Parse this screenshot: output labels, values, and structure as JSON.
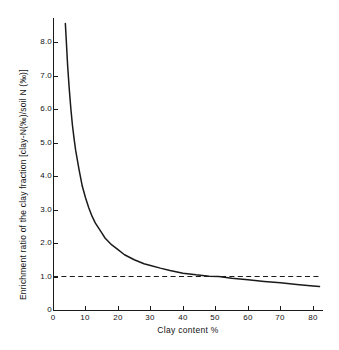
{
  "figure": {
    "background_color": "#ffffff",
    "ink_color": "#1a1a1a"
  },
  "chart_data": {
    "type": "line",
    "title": "",
    "xlabel": "Clay content %",
    "ylabel": "Enrichment ratio of the clay fraction [clay-N(‰)/soil N (‰)]",
    "xlim": [
      0,
      82
    ],
    "ylim": [
      0,
      8.6
    ],
    "grid": false,
    "legend": "none",
    "x_ticks": [
      0,
      10,
      20,
      30,
      40,
      50,
      60,
      70,
      80
    ],
    "x_tick_labels": [
      "0",
      "10",
      "20",
      "30",
      "40",
      "50",
      "60",
      "70",
      "80"
    ],
    "y_ticks": [
      0,
      1.0,
      2.0,
      3.0,
      4.0,
      5.0,
      6.0,
      7.0,
      8.0
    ],
    "y_tick_labels": [
      "0",
      "1.0",
      "2.0",
      "3.0",
      "4.0",
      "5.0",
      "6.0",
      "7.0",
      "8.0"
    ],
    "series": [
      {
        "name": "Enrichment ratio curve",
        "style": "solid",
        "color": "#1a1a1a",
        "relation": "ER = 33 / clay%",
        "x": [
          3.8,
          4.0,
          4.5,
          5.0,
          5.5,
          6.0,
          6.5,
          7.0,
          8.0,
          9.0,
          10.0,
          11.0,
          12.0,
          13.0,
          14.0,
          15.0,
          16.0,
          18.0,
          20.0,
          22.0,
          25.0,
          28.0,
          30.0,
          33.0,
          36.0,
          40.0,
          44.0,
          48.0,
          51.0,
          55.0,
          60.0,
          65.0,
          70.0,
          75.0,
          80.0,
          82.0
        ],
        "y": [
          8.55,
          8.2,
          7.3,
          6.6,
          6.0,
          5.5,
          5.1,
          4.75,
          4.2,
          3.7,
          3.35,
          3.05,
          2.8,
          2.6,
          2.45,
          2.3,
          2.15,
          1.95,
          1.8,
          1.65,
          1.5,
          1.38,
          1.33,
          1.25,
          1.18,
          1.1,
          1.05,
          1.01,
          1.0,
          0.95,
          0.9,
          0.85,
          0.81,
          0.76,
          0.72,
          0.7
        ]
      },
      {
        "name": "Reference line at ratio 1.0",
        "style": "dashed",
        "color": "#1a1a1a",
        "value": 1.0,
        "x_start": 0,
        "x_end": 82
      }
    ],
    "annotations": [
      {
        "text": "crossing of curve and reference line",
        "x": 51,
        "y": 1.0
      }
    ]
  }
}
